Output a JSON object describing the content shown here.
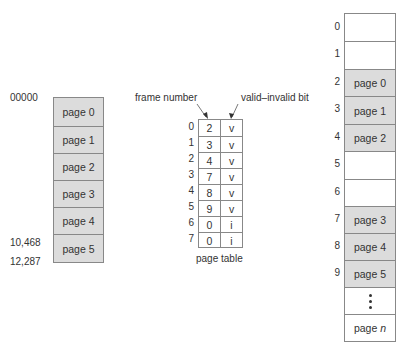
{
  "logical_memory": {
    "start_address": "00000",
    "last_page_start_address": "10,468",
    "end_address": "12,287",
    "pages": [
      "page 0",
      "page 1",
      "page 2",
      "page 3",
      "page 4",
      "page 5"
    ]
  },
  "page_table": {
    "caption": "page table",
    "frame_number_label": "frame number",
    "valid_invalid_label": "valid–invalid bit",
    "rows": [
      {
        "index": "0",
        "frame": "2",
        "bit": "v"
      },
      {
        "index": "1",
        "frame": "3",
        "bit": "v"
      },
      {
        "index": "2",
        "frame": "4",
        "bit": "v"
      },
      {
        "index": "3",
        "frame": "7",
        "bit": "v"
      },
      {
        "index": "4",
        "frame": "8",
        "bit": "v"
      },
      {
        "index": "5",
        "frame": "9",
        "bit": "v"
      },
      {
        "index": "6",
        "frame": "0",
        "bit": "i"
      },
      {
        "index": "7",
        "frame": "0",
        "bit": "i"
      }
    ]
  },
  "physical_memory": {
    "frames": [
      {
        "index": "0",
        "content": ""
      },
      {
        "index": "1",
        "content": ""
      },
      {
        "index": "2",
        "content": "page 0"
      },
      {
        "index": "3",
        "content": "page 1"
      },
      {
        "index": "4",
        "content": "page 2"
      },
      {
        "index": "5",
        "content": ""
      },
      {
        "index": "6",
        "content": ""
      },
      {
        "index": "7",
        "content": "page 3"
      },
      {
        "index": "8",
        "content": "page 4"
      },
      {
        "index": "9",
        "content": "page 5"
      },
      {
        "index": "",
        "content": "ellipsis"
      },
      {
        "index": "",
        "content": "page n"
      }
    ],
    "last_page_prefix": "page ",
    "last_page_var": "n"
  },
  "colors": {
    "shaded_fill": "#dcdcdc",
    "border": "#888888",
    "text": "#333333"
  }
}
